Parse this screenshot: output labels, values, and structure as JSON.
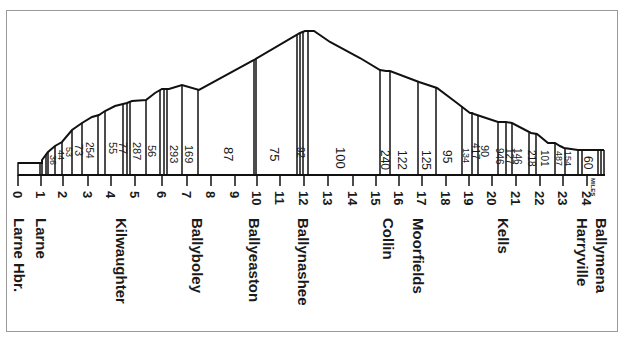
{
  "diagram": {
    "axis_unit": "MILES",
    "mile_ticks": [
      "0",
      "1",
      "2",
      "3",
      "4",
      "5",
      "6",
      "7",
      "8",
      "9",
      "10",
      "11",
      "12",
      "13",
      "14",
      "15",
      "16",
      "17",
      "18",
      "19",
      "20",
      "21",
      "22",
      "23",
      "24"
    ],
    "stations": [
      {
        "name": "Larne Hbr.",
        "mile": 0
      },
      {
        "name": "Larne",
        "mile": 1
      },
      {
        "name": "Kilwaughter",
        "mile": 4.5
      },
      {
        "name": "Ballyboley",
        "mile": 7.7
      },
      {
        "name": "Ballyeaston",
        "mile": 10
      },
      {
        "name": "Ballynashee",
        "mile": 12
      },
      {
        "name": "Collin",
        "mile": 15.5
      },
      {
        "name": "Moorfields",
        "mile": 17
      },
      {
        "name": "Kells",
        "mile": 20.5
      },
      {
        "name": "Harryville",
        "mile": 24
      },
      {
        "name": "Ballymena",
        "mile": 24.5
      }
    ],
    "gradients": [
      "36",
      "44",
      "53",
      "73",
      "254",
      "55",
      "77",
      "287",
      "56",
      "293",
      "169",
      "87",
      "75",
      "92",
      "100",
      "240",
      "122",
      "125",
      "95",
      "134",
      "417",
      "90",
      "946",
      "127",
      "146",
      "218",
      "101",
      "487",
      "154",
      "60"
    ]
  }
}
